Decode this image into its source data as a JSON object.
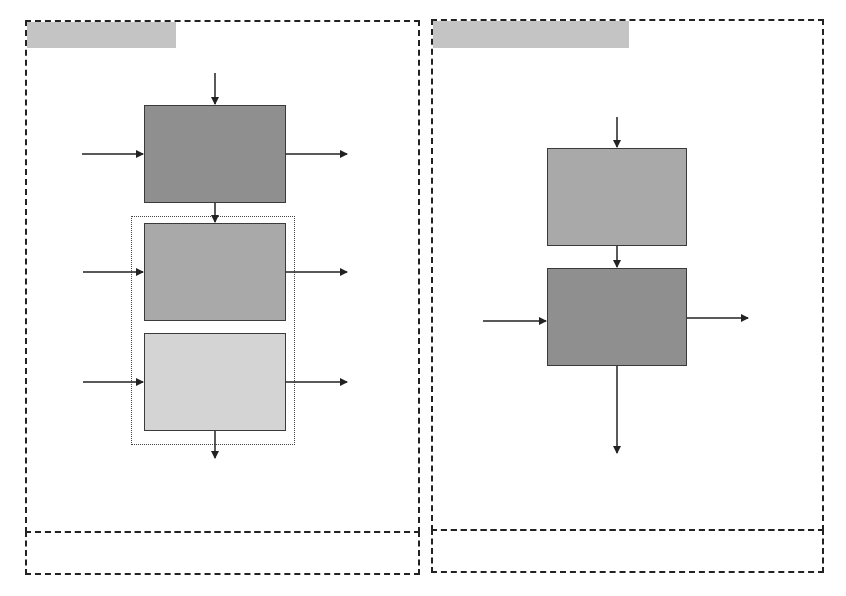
{
  "colors": {
    "dark_block": "#8f8f8f",
    "mid_block": "#a9a9a9",
    "light_block": "#d4d4d4",
    "title_bar": "#c4c4c4",
    "line": "#222222"
  },
  "left_panel": {
    "title": "",
    "caption": "",
    "blocks": [
      {
        "label": "",
        "shade": "dark"
      },
      {
        "label": "",
        "shade": "mid"
      },
      {
        "label": "",
        "shade": "light"
      }
    ],
    "group_label": ""
  },
  "right_panel": {
    "title": "",
    "caption": "",
    "blocks": [
      {
        "label": "",
        "shade": "mid"
      },
      {
        "label": "",
        "shade": "dark"
      }
    ]
  }
}
